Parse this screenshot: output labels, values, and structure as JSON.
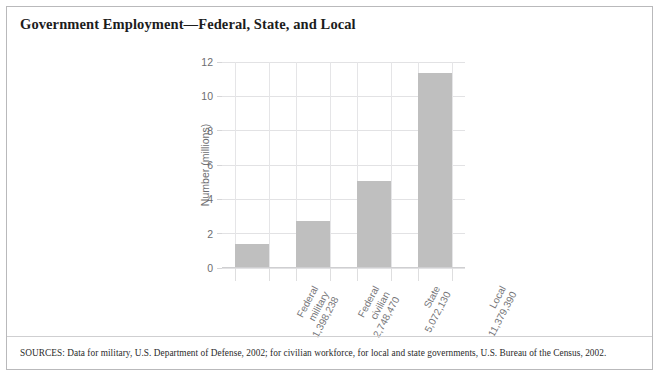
{
  "figure": {
    "title": "Government Employment—Federal, State, and Local",
    "sources": "SOURCES: Data for military, U.S. Department of Defense, 2002; for civilian workforce, for local and state governments, U.S. Bureau of the Census, 2002.",
    "border_color": "#b9b9bb",
    "background": "#ffffff"
  },
  "chart_data": {
    "type": "bar",
    "title": "Government Employment—Federal, State, and Local",
    "xlabel": "",
    "ylabel": "Number (millions)",
    "ylim": [
      0,
      12
    ],
    "yticks": [
      0,
      2,
      4,
      6,
      8,
      10,
      12
    ],
    "ytick_labels": [
      "0",
      "2",
      "4",
      "6",
      "8",
      "10",
      "12"
    ],
    "grid": "both",
    "legend": "none",
    "bar_color": "#bfbfbf",
    "categories": [
      "Federal military",
      "Federal civilian",
      "State",
      "Local"
    ],
    "category_lines": [
      {
        "line1": "Federal",
        "line2": "military",
        "line3": "1,398,238"
      },
      {
        "line1": "Federal",
        "line2": "civilian",
        "line3": "2,748,470"
      },
      {
        "line1": "State",
        "line2": "",
        "line3": "5,072,130"
      },
      {
        "line1": "Local",
        "line2": "",
        "line3": "11,379,390"
      }
    ],
    "raw_counts": [
      1398238,
      2748470,
      5072130,
      11379390
    ],
    "count_labels": [
      "1,398,238",
      "2,748,470",
      "5,072,130",
      "11,379,390"
    ],
    "values": [
      1.398238,
      2.74847,
      5.07213,
      11.37939
    ],
    "value_unit": "millions"
  }
}
